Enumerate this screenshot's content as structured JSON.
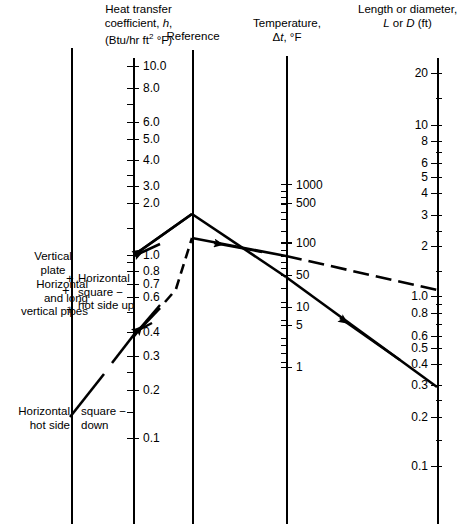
{
  "figure": {
    "type": "nomograph",
    "axes": [
      {
        "id": "left-guide",
        "name": "left-guide-axis",
        "title": "",
        "x": 71,
        "y_top": 48,
        "y_bottom": 524,
        "ticks": []
      },
      {
        "id": "h",
        "name": "heat-transfer-coefficient-axis",
        "title_lines": [
          "Heat transfer",
          "coefficient, h,",
          "(Btu/hr ft2 °F)"
        ],
        "x": 133,
        "y_top": 58,
        "y_bottom": 524,
        "scale": "log",
        "labels": [
          "10.0",
          "8.0",
          "6.0",
          "5.0",
          "4.0",
          "3.0",
          "2.0",
          "1.0",
          "0.8",
          "0.7",
          "0.6",
          "0.4",
          "0.3",
          "0.2",
          "0.1"
        ]
      },
      {
        "id": "reference",
        "name": "reference-axis",
        "title_lines": [
          "Reference"
        ],
        "x": 192,
        "y_top": 50,
        "y_bottom": 524,
        "ticks": []
      },
      {
        "id": "dt",
        "name": "temperature-difference-axis",
        "title_lines": [
          "Temperature,",
          "Δt, °F"
        ],
        "x": 286,
        "y_top": 56,
        "y_bottom": 524,
        "scale": "log",
        "labels": [
          "1000",
          "500",
          "100",
          "50",
          "10",
          "5",
          "1"
        ]
      },
      {
        "id": "LD",
        "name": "length-or-diameter-axis",
        "title_lines": [
          "Length or diameter,",
          "L or D (ft)"
        ],
        "x": 437,
        "y_top": 58,
        "y_bottom": 524,
        "scale": "log",
        "labels": [
          "20",
          "10",
          "8",
          "6",
          "5",
          "4",
          "3",
          "2",
          "1.0",
          "0.8",
          "0.6",
          "0.5",
          "0.4",
          "0.3",
          "0.2",
          "0.1"
        ]
      }
    ],
    "annotations": {
      "vertical_plate": "Vertical\nplate",
      "vertical_plate_l1": "Vertical",
      "vertical_plate_l2": "plate",
      "horizontal_pipes_l1": "Horizontal",
      "horizontal_pipes_l2": "and long",
      "horizontal_pipes_l3": "vertical pipes",
      "horiz_square_up_l1": "Horizontal",
      "horiz_square_up_l2": "square −",
      "horiz_square_up_l3": "hot side up",
      "horiz_hot_side_l1": "Horizontal",
      "horiz_hot_side_l2": "hot side",
      "square_down_l1": "square −",
      "square_down_l2": "down",
      "plus_1": "+",
      "plus_2": "+",
      "plus_3": "+"
    },
    "tick_labels": {
      "h_10": "10.0",
      "h_8": "8.0",
      "h_6": "6.0",
      "h_5": "5.0",
      "h_4": "4.0",
      "h_3": "3.0",
      "h_2": "2.0",
      "h_1": "1.0",
      "h_08": "0.8",
      "h_07": "0.7",
      "h_06": "0.6",
      "h_04": "0.4",
      "h_03": "0.3",
      "h_02": "0.2",
      "h_01": "0.1",
      "t_1000": "1000",
      "t_500": "500",
      "t_100": "100",
      "t_50": "50",
      "t_10": "10",
      "t_5": "5",
      "t_1": "1",
      "L_20": "20",
      "L_10": "10",
      "L_8": "8",
      "L_6": "6",
      "L_5": "5",
      "L_4": "4",
      "L_3": "3",
      "L_2": "2",
      "L_1": "1.0",
      "L_08": "0.8",
      "L_06": "0.6",
      "L_05": "0.5",
      "L_04": "0.4",
      "L_03": "0.3",
      "L_02": "0.2",
      "L_01": "0.1"
    },
    "solution_lines": [
      {
        "name": "construction-line-upper",
        "style": "solid",
        "points": [
          [
            132,
            254
          ],
          [
            192,
            214
          ],
          [
            286,
            240
          ],
          [
            437,
            355
          ]
        ],
        "description": "solid line: h ~1.0 to reference peak to dt ~50 to L ~0.3"
      },
      {
        "name": "construction-line-dashed",
        "style": "dashed",
        "points": [
          [
            133,
            336
          ],
          [
            192,
            236
          ],
          [
            286,
            246
          ],
          [
            437,
            264
          ]
        ],
        "description": "dashed line: h ~0.4 to reference lower vertex to dt ~100 to L ~1.0"
      },
      {
        "name": "lower-left-line",
        "style": "dashed-solid",
        "points": [
          [
            70,
            415
          ],
          [
            133,
            336
          ]
        ],
        "description": "line from Horizontal hot side down label to h ~0.4"
      }
    ],
    "colors": {
      "ink": "#000000",
      "background": "#ffffff"
    }
  }
}
